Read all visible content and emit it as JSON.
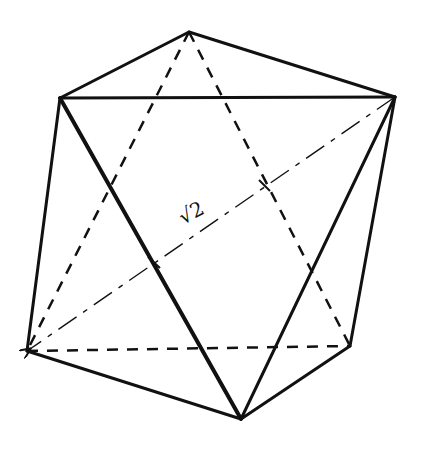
{
  "diagram": {
    "type": "polyhedron-sketch",
    "label": "√2",
    "vertices": {
      "top": [
        189,
        32
      ],
      "upper_left": [
        60,
        98
      ],
      "upper_right": [
        395,
        97
      ],
      "lower_left": [
        27,
        351
      ],
      "lower_right": [
        350,
        346
      ],
      "bottom": [
        241,
        419
      ]
    },
    "visible_edges": [
      [
        "top",
        "upper_left"
      ],
      [
        "top",
        "upper_right"
      ],
      [
        "upper_left",
        "upper_right"
      ],
      [
        "upper_left",
        "lower_left"
      ],
      [
        "upper_left",
        "bottom"
      ],
      [
        "upper_right",
        "bottom"
      ],
      [
        "upper_right",
        "lower_right"
      ],
      [
        "lower_left",
        "bottom"
      ],
      [
        "lower_right",
        "bottom"
      ]
    ],
    "hidden_edges": [
      [
        "top",
        "lower_left"
      ],
      [
        "top",
        "lower_right"
      ],
      [
        "lower_left",
        "lower_right"
      ]
    ],
    "diagonal": {
      "from": "upper_right",
      "to": "lower_left",
      "style": "dash-dot",
      "arrow": "lower_left"
    }
  }
}
